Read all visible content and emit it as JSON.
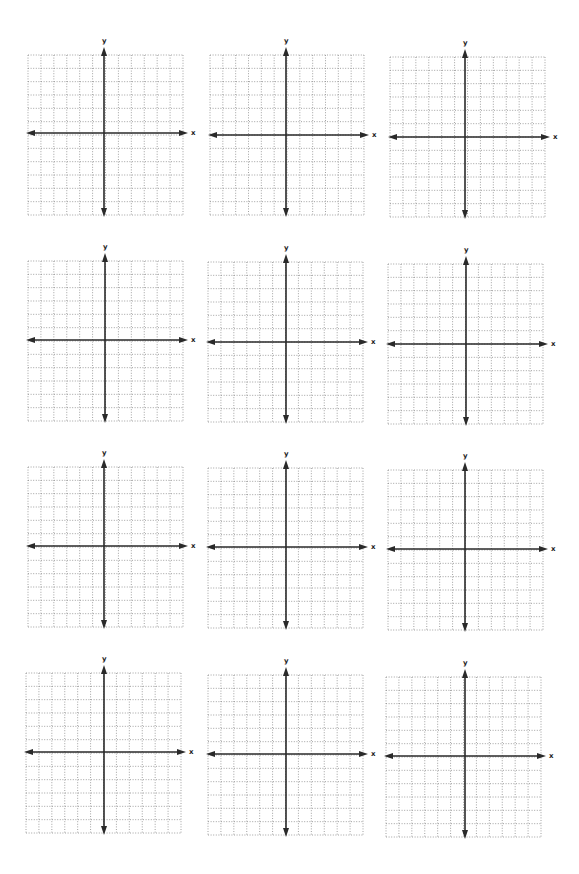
{
  "worksheet": {
    "grid_cells": 12,
    "axis_color": "#2a2a2a",
    "grid_color": "#8a8a8a",
    "planes": [
      {
        "x_label": "x",
        "y_label": "y",
        "left": 28,
        "top": 55,
        "width": 155,
        "height": 160,
        "axis_x": 104,
        "axis_y": 133
      },
      {
        "x_label": "x",
        "y_label": "y",
        "left": 210,
        "top": 55,
        "width": 154,
        "height": 160,
        "axis_x": 286,
        "axis_y": 135
      },
      {
        "x_label": "x",
        "y_label": "y",
        "left": 390,
        "top": 57,
        "width": 155,
        "height": 160,
        "axis_x": 465,
        "axis_y": 137
      },
      {
        "x_label": "x",
        "y_label": "y",
        "left": 28,
        "top": 261,
        "width": 155,
        "height": 160,
        "axis_x": 105,
        "axis_y": 340
      },
      {
        "x_label": "x",
        "y_label": "y",
        "left": 208,
        "top": 262,
        "width": 155,
        "height": 160,
        "axis_x": 286,
        "axis_y": 342
      },
      {
        "x_label": "x",
        "y_label": "y",
        "left": 388,
        "top": 264,
        "width": 155,
        "height": 160,
        "axis_x": 466,
        "axis_y": 344
      },
      {
        "x_label": "x",
        "y_label": "y",
        "left": 28,
        "top": 467,
        "width": 155,
        "height": 160,
        "axis_x": 104,
        "axis_y": 546
      },
      {
        "x_label": "x",
        "y_label": "y",
        "left": 208,
        "top": 468,
        "width": 155,
        "height": 160,
        "axis_x": 286,
        "axis_y": 547
      },
      {
        "x_label": "x",
        "y_label": "y",
        "left": 388,
        "top": 470,
        "width": 155,
        "height": 160,
        "axis_x": 465,
        "axis_y": 549
      },
      {
        "x_label": "x",
        "y_label": "y",
        "left": 26,
        "top": 673,
        "width": 155,
        "height": 160,
        "axis_x": 104,
        "axis_y": 752
      },
      {
        "x_label": "x",
        "y_label": "y",
        "left": 208,
        "top": 675,
        "width": 155,
        "height": 160,
        "axis_x": 286,
        "axis_y": 754
      },
      {
        "x_label": "x",
        "y_label": "y",
        "left": 386,
        "top": 677,
        "width": 155,
        "height": 160,
        "axis_x": 465,
        "axis_y": 756
      }
    ]
  }
}
